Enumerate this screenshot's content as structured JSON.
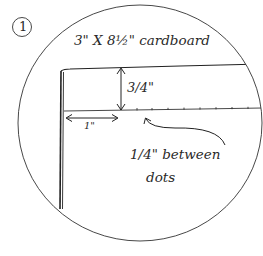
{
  "diagram": {
    "step_number": "1",
    "title": "3\" X 8½\" cardboard",
    "height_label": "3/4\"",
    "width_label": "1\"",
    "note_line1": "1/4\" between",
    "note_line2": "dots",
    "colors": {
      "ink": "#2a2a2a",
      "background": "#ffffff"
    }
  }
}
